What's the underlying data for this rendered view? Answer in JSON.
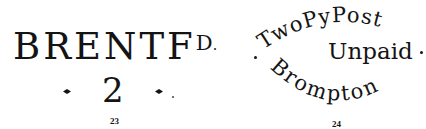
{
  "figures": [
    {
      "caption": "23",
      "stamp": {
        "line1_main": "BRENTF",
        "line1_superscript": "D",
        "line1_superscript_dot": ".",
        "line2_number": "2",
        "line2_ornament": "diamond-dots"
      }
    },
    {
      "caption": "24",
      "stamp": {
        "shape": "oval-arc-text",
        "top_arc": "TwoPyPost",
        "middle": "Unpaid",
        "bottom_arc": "Brompton",
        "side_ornament": "dots"
      }
    }
  ],
  "colors": {
    "ink": "#141414",
    "background": "#ffffff"
  }
}
